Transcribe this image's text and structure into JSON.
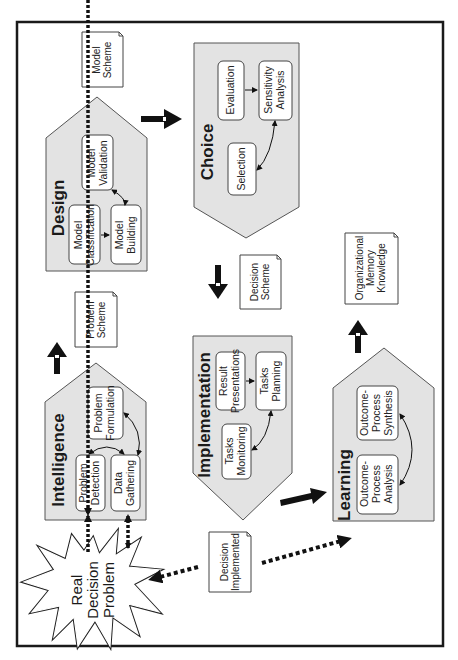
{
  "diagram": {
    "orientation": "rotated-90-ccw",
    "colors": {
      "border": "#1a1a1a",
      "stage_fill": "#e3e3e3",
      "stage_stroke": "#555555",
      "box_fill": "#ffffff",
      "note_fill": "#ffffff",
      "arrow": "#111111"
    },
    "stages": {
      "intelligence": {
        "title": "Intelligence",
        "boxes": {
          "problem_detection": [
            "Problem",
            "Detection"
          ],
          "data_gathering": [
            "Data",
            "Gathering"
          ],
          "problem_formulation": [
            "Problem",
            "Formulation"
          ]
        }
      },
      "design": {
        "title": "Design",
        "boxes": {
          "model_classification": [
            "Model",
            "Classification"
          ],
          "model_building": [
            "Model",
            "Building"
          ],
          "model_validation": [
            "Model",
            "Validation"
          ]
        }
      },
      "choice": {
        "title": "Choice",
        "boxes": {
          "evaluation": [
            "Evaluation"
          ],
          "sensitivity_analysis": [
            "Sensitivity",
            "Analysis"
          ],
          "selection": [
            "Selection"
          ]
        }
      },
      "implementation": {
        "title": "Implementation",
        "boxes": {
          "result_presentations": [
            "Result",
            "Presentations"
          ],
          "tasks_planning": [
            "Tasks",
            "Planning"
          ],
          "tasks_monitoring": [
            "Tasks",
            "Monitoring"
          ]
        }
      },
      "learning": {
        "title": "Learning",
        "boxes": {
          "outcome_process_analysis": [
            "Outcome-",
            "Process",
            "Analysis"
          ],
          "outcome_process_synthesis": [
            "Outcome-",
            "Process",
            "Synthesis"
          ]
        }
      }
    },
    "notes": {
      "model_scheme": [
        "Model",
        "Scheme"
      ],
      "problem_scheme": [
        "Problem",
        "Scheme"
      ],
      "decision_scheme": [
        "Decision",
        "Scheme"
      ],
      "organizational_memory": [
        "Organizational",
        "Memory",
        "Knowledge"
      ],
      "decision_implemented": [
        "Decision",
        "Implemented"
      ]
    },
    "real_problem": [
      "Real",
      "Decision",
      "Problem"
    ]
  }
}
